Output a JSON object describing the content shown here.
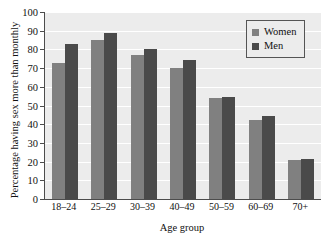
{
  "chart_data": {
    "type": "bar",
    "title": "",
    "xlabel": "Age group",
    "ylabel": "Percentage having sex more than monthly",
    "categories": [
      "18–24",
      "25–29",
      "30–39",
      "40–49",
      "50–59",
      "60–69",
      "70+"
    ],
    "series": [
      {
        "name": "Women",
        "color": "#808080",
        "values": [
          73,
          85,
          77,
          70,
          54,
          42,
          21
        ]
      },
      {
        "name": "Men",
        "color": "#4a4a4a",
        "values": [
          83,
          89,
          80,
          74.5,
          54.5,
          44.5,
          21.5
        ]
      }
    ],
    "ylim": [
      0,
      100
    ],
    "yticks": [
      0,
      10,
      20,
      30,
      40,
      50,
      60,
      70,
      80,
      90,
      100
    ],
    "ytick_labels": [
      "0",
      "10",
      "20",
      "30",
      "40",
      "50",
      "60",
      "70",
      "80",
      "90",
      "100"
    ],
    "grid": true,
    "grid_color": "#ffffff",
    "plot_background": "#ececec",
    "legend_position": "top-right",
    "legend_entries": [
      "Women",
      "Men"
    ]
  }
}
